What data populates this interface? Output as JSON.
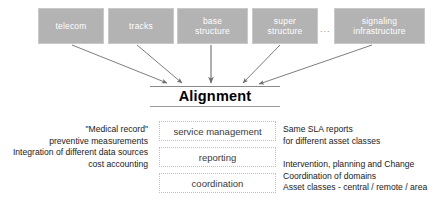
{
  "diagram": {
    "title": "Alignment",
    "asset_boxes": [
      {
        "label": "telecom",
        "lines": [
          "telecom"
        ]
      },
      {
        "label": "tracks",
        "lines": [
          "tracks"
        ]
      },
      {
        "label": "base structure",
        "lines": [
          "base",
          "structure"
        ]
      },
      {
        "label": "super structure",
        "lines": [
          "super",
          "structure"
        ]
      },
      {
        "label": "signaling infrastructure",
        "lines": [
          "signaling",
          "infrastructure"
        ]
      }
    ],
    "ellipsis": "...",
    "center_boxes": [
      {
        "label": "service management"
      },
      {
        "label": "reporting"
      },
      {
        "label": "coordination"
      }
    ],
    "left_notes": "\"Medical record\"\npreventive measurements\nIntegration of different data sources\ncost accounting",
    "right_notes_top": "Same SLA reports\nfor different asset classes",
    "right_notes_bottom": "Intervention, planning and Change\nCoordination of domains\nAsset classes - central / remote / area",
    "colors": {
      "asset_box_fill": "#b3b3b3",
      "asset_box_text": "#ffffff",
      "arrow": "#6e6e6e",
      "rule": "#8a8a8a",
      "center_box_border": "#c0c0c0",
      "background": "#ffffff"
    }
  }
}
